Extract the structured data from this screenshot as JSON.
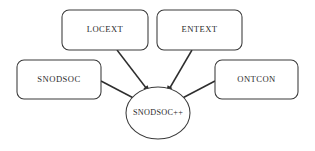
{
  "diagram": {
    "background_color": "#ffffff",
    "stroke_color": "#3a3a3a",
    "text_color": "#2b2b2b",
    "nodes": [
      {
        "id": "locext",
        "label": "LOCEXT",
        "shape": "rounded-rect",
        "x": 62,
        "y": 10,
        "w": 86,
        "h": 40
      },
      {
        "id": "entext",
        "label": "ENTEXT",
        "shape": "rounded-rect",
        "x": 157,
        "y": 10,
        "w": 85,
        "h": 40
      },
      {
        "id": "snodsoc",
        "label": "SNODSOC",
        "shape": "rounded-rect",
        "x": 17,
        "y": 60,
        "w": 84,
        "h": 39
      },
      {
        "id": "ontcon",
        "label": "ONTCON",
        "shape": "rounded-rect",
        "x": 215,
        "y": 60,
        "w": 83,
        "h": 39
      },
      {
        "id": "snodsocpp",
        "label": "SNODSOC++",
        "shape": "ellipse",
        "cx": 158,
        "cy": 113,
        "rx": 32,
        "ry": 26
      }
    ],
    "edges": [
      {
        "id": "edge-locext-to-center",
        "from": "locext",
        "to": "snodsocpp",
        "arrow": "to"
      },
      {
        "id": "edge-entext-to-center",
        "from": "entext",
        "to": "snodsocpp",
        "arrow": "to"
      },
      {
        "id": "edge-snodsoc-to-center",
        "from": "snodsoc",
        "to": "snodsocpp",
        "arrow": "none"
      },
      {
        "id": "edge-ontcon-to-center",
        "from": "ontcon",
        "to": "snodsocpp",
        "arrow": "none"
      }
    ]
  }
}
